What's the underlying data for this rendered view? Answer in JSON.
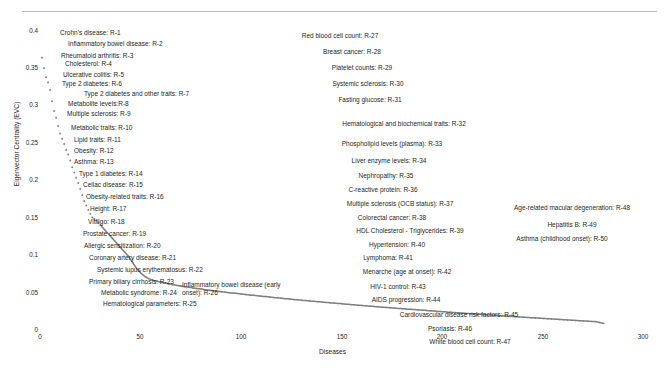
{
  "chart_data": {
    "type": "scatter",
    "title": "",
    "xlabel": "Diseases",
    "ylabel": "Eigenvector Centrality (EVC)",
    "xlim": [
      0,
      300
    ],
    "ylim": [
      0,
      0.4
    ],
    "xticks": [
      "0",
      "50",
      "100",
      "150",
      "200",
      "250",
      "300"
    ],
    "xtick_values": [
      0,
      50,
      100,
      150,
      200,
      250,
      300
    ],
    "yticks": [
      "0",
      "0.05",
      "0.1",
      "0.15",
      "0.2",
      "0.25",
      "0.3",
      "0.35",
      "0.4"
    ],
    "ytick_values": [
      0,
      0.05,
      0.1,
      0.15,
      0.2,
      0.25,
      0.3,
      0.35,
      0.4
    ],
    "grid": false,
    "legend": "none",
    "marker_color": "#7f7f7f",
    "series_name": "Eigenvector Centrality",
    "x": [
      1,
      2,
      3,
      4,
      5,
      6,
      7,
      8,
      9,
      10,
      11,
      12,
      13,
      14,
      15,
      16,
      17,
      18,
      19,
      20,
      21,
      22,
      23,
      24,
      25,
      26,
      27,
      28,
      29,
      30,
      31,
      32,
      33,
      34,
      35,
      36,
      37,
      38,
      39,
      40,
      41,
      42,
      43,
      44,
      45,
      46,
      47,
      48,
      49,
      50,
      52,
      54,
      56,
      58,
      60,
      63,
      66,
      69,
      72,
      75,
      78,
      81,
      84,
      87,
      90,
      94,
      98,
      102,
      106,
      110,
      115,
      120,
      125,
      130,
      135,
      140,
      146,
      152,
      158,
      164,
      170,
      177,
      184,
      191,
      198,
      205,
      212,
      220,
      228,
      236,
      244,
      252,
      260,
      268,
      276,
      280
    ],
    "y": [
      0.363,
      0.349,
      0.337,
      0.33,
      0.32,
      0.305,
      0.292,
      0.283,
      0.272,
      0.262,
      0.255,
      0.248,
      0.24,
      0.234,
      0.226,
      0.217,
      0.21,
      0.203,
      0.196,
      0.188,
      0.18,
      0.172,
      0.166,
      0.16,
      0.155,
      0.15,
      0.148,
      0.146,
      0.143,
      0.14,
      0.137,
      0.134,
      0.131,
      0.128,
      0.125,
      0.122,
      0.119,
      0.116,
      0.113,
      0.11,
      0.107,
      0.104,
      0.101,
      0.098,
      0.094,
      0.09,
      0.086,
      0.082,
      0.079,
      0.076,
      0.0715,
      0.0685,
      0.0665,
      0.065,
      0.0638,
      0.062,
      0.0604,
      0.059,
      0.0577,
      0.0565,
      0.0553,
      0.0542,
      0.0531,
      0.0521,
      0.0511,
      0.0498,
      0.0486,
      0.0474,
      0.0462,
      0.0451,
      0.0437,
      0.0423,
      0.041,
      0.0397,
      0.0385,
      0.0373,
      0.0359,
      0.0345,
      0.0331,
      0.0318,
      0.0305,
      0.029,
      0.0276,
      0.0262,
      0.0248,
      0.0234,
      0.0221,
      0.0207,
      0.0192,
      0.0178,
      0.0164,
      0.015,
      0.0137,
      0.0124,
      0.0112,
      0.0088,
      0.006
    ]
  },
  "axes": {
    "y_title": "Eigenvector Centrality (EVC)",
    "x_title": "Diseases",
    "y_ticks": [
      "0.4",
      "0.35",
      "0.3",
      "0.25",
      "0.2",
      "0.15",
      "0.1",
      "0.05",
      "0"
    ],
    "x_ticks": [
      "0",
      "50",
      "100",
      "150",
      "200",
      "250",
      "300"
    ]
  },
  "annotations": {
    "left_column": [
      {
        "text": "Crohn's disease: R-1"
      },
      {
        "text": "Inflammatory bowel disease: R-2"
      },
      {
        "text": "Rheumatoid arthritis: R-3"
      },
      {
        "text": "Cholesterol: R-4"
      },
      {
        "text": "Ulcerative colitis: R-5"
      },
      {
        "text": "Type 2 diabetes: R-6"
      },
      {
        "text": "Type 2 diabetes and other traits: R-7"
      },
      {
        "text": "Metabolite levels:R-8"
      },
      {
        "text": "Multiple sclerosis: R-9"
      },
      {
        "text": "Metabolic traits: R-10"
      },
      {
        "text": "Lipid traits: R-11"
      },
      {
        "text": "Obesity: R-12"
      },
      {
        "text": "Asthma: R-13"
      },
      {
        "text": "Type 1 diabetes: R-14"
      },
      {
        "text": "Celiac disease: R-15"
      },
      {
        "text": "Obesity-related traits: R-16"
      },
      {
        "text": "Height: R-17"
      },
      {
        "text": "Vitiligo: R-18"
      },
      {
        "text": "Prostate cancer: R-19"
      },
      {
        "text": "Allergic sensitization: R-20"
      },
      {
        "text": "Coronary artery disease: R-21"
      },
      {
        "text": "Systemic lupus erythematosus: R-22"
      },
      {
        "text": "Primary biliary cirrhosis: R-23"
      },
      {
        "text": "Metabolic syndrome: R-24"
      },
      {
        "text": "Hematological parameters: R-25"
      },
      {
        "text": "Inflammatory bowel disease (early onset): R-26"
      }
    ],
    "middle_column": [
      {
        "text": "Red blood cell count: R-27"
      },
      {
        "text": "Breast cancer: R-28"
      },
      {
        "text": "Platelet counts: R-29"
      },
      {
        "text": "Systemic sclerosis: R-30"
      },
      {
        "text": "Fasting glucose: R-31"
      },
      {
        "text": "Hematological and biochemical traits: R-32"
      },
      {
        "text": "Phospholipid levels (plasma): R-33"
      },
      {
        "text": "Liver enzyme levels: R-34"
      },
      {
        "text": "Nephropathy: R-35"
      },
      {
        "text": "C-reactive protein: R-36"
      },
      {
        "text": "Multiple sclerosis (OCB status): R-37"
      },
      {
        "text": "Colorectal cancer: R-38"
      },
      {
        "text": "HDL Cholesterol - Triglycerides: R-39"
      },
      {
        "text": "Hypertension: R-40"
      },
      {
        "text": "Lymphoma: R-41"
      },
      {
        "text": "Menarche (age at onset): R-42"
      },
      {
        "text": "HIV-1 control: R-43"
      },
      {
        "text": "AIDS progression: R-44"
      },
      {
        "text": "Cardiovascular disease risk factors: R-45"
      },
      {
        "text": "Psoriasis: R-46"
      },
      {
        "text": "White blood cell count: R-47"
      }
    ],
    "right_column": [
      {
        "text": "Age-related macular degeneration: R-48"
      },
      {
        "text": "Hepatitis B: R-49"
      },
      {
        "text": "Asthma (childhood onset): R-50"
      }
    ]
  }
}
